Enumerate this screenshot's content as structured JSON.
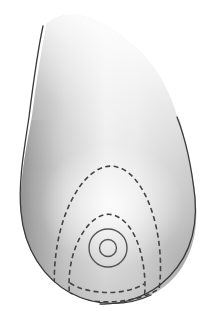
{
  "figure": {
    "title": "Lateral view of breast with areola and dashed tissue contours",
    "caption": "",
    "background_color": "#ffffff",
    "canvas": {
      "width": 220,
      "height": 319
    }
  },
  "rendering": {
    "style": "grayscale-shaded-anatomical-illustration",
    "outline_color": "#3a3a3a",
    "outline_width": 1.3,
    "dashed_color": "#444444",
    "dashed_width": 1.6,
    "dash_pattern": "5,3.4",
    "circle_stroke_color": "#555555",
    "circle_stroke_width": 1.4,
    "fill_light": "#fbfbfb",
    "fill_mid": "#cfcfcf",
    "fill_dark": "#8d8d8d",
    "fill_darker": "#8a8a8a",
    "highlight_color": "#fdfdfd"
  },
  "shapes": {
    "body_outline": {
      "name": "breast-silhouette",
      "path": "M 47 24 C 41 52 36 84 32 116 C 26 150 19 182 21 211 C 23 247 42 278 70 293 C 94 306 126 307 151 295 C 177 282 194 256 196 222 C 198 193 190 166 185 141 C 181 122 179 117 177 117 C 174 105 168 90 158 74 C 142 50 118 30 95 20 C 78 13 61 12 47 24 Z"
    },
    "left_edge_outline": {
      "name": "left-contour-line",
      "path": "M 43 26 C 37 54 33 85 29 117 C 24 151 18 183 21 212 C 24 249 44 279 72 294"
    },
    "right_edge_outline": {
      "name": "right-contour-line",
      "path": "M 177 117 C 186 140 192 170 195 198 C 198 234 186 264 160 285 C 143 298 120 305 100 304"
    },
    "bottom_outline": {
      "name": "bottom-contour-line",
      "path": "M 71 293 C 94 306 126 307 151 295"
    },
    "outer_dashed_contour": {
      "name": "outer-tissue-boundary",
      "path": "M 55 300 C 52 262 58 223 75 194 C 87 173 103 163 117 167 C 134 171 148 194 155 222 C 162 250 162 279 157 300"
    },
    "inner_dashed_contour": {
      "name": "inner-tissue-boundary",
      "path": "M 70 300 C 67 276 71 252 82 234 C 91 219 103 212 113 215 C 125 218 135 232 140 250 C 145 268 146 286 144 300"
    },
    "inner_dashed_bottom_curve": {
      "name": "inner-boundary-bottom-arc",
      "path": "M 70 283 C 88 295 124 296 144 284"
    },
    "outer_dashed_bottom_curve": {
      "name": "outer-boundary-bottom-arc",
      "path": "M 55 289 C 85 306 130 306 157 290"
    },
    "areola_circle": {
      "name": "areola-outer-circle",
      "cx": 108,
      "cy": 248,
      "r": 19
    },
    "nipple_circle": {
      "name": "nipple-inner-circle",
      "cx": 108,
      "cy": 248,
      "r": 8.5
    }
  },
  "labels": {
    "areola": "",
    "nipple": "",
    "outer_contour": "",
    "inner_contour": ""
  }
}
